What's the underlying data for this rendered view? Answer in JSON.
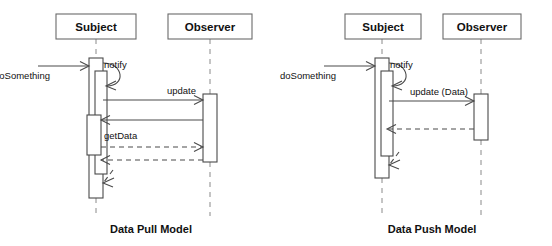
{
  "diagrams": [
    {
      "id": "data-pull",
      "caption": "Data Pull Model",
      "caption_x": 151,
      "caption_y": 233,
      "participants": [
        {
          "name": "Subject",
          "label": "Subject",
          "x": 96,
          "box_x": 56,
          "box_y": 14,
          "box_w": 80,
          "box_h": 25
        },
        {
          "name": "Observer",
          "label": "Observer",
          "x": 210,
          "box_x": 168,
          "box_y": 14,
          "box_w": 84,
          "box_h": 25
        }
      ],
      "messages": [
        {
          "name": "doSomething",
          "label": "doSomething",
          "style": "solid",
          "label_x": 50,
          "label_y": 76
        },
        {
          "name": "notify",
          "label": "notify",
          "style": "solid",
          "label_x": 111,
          "label_y": 65
        },
        {
          "name": "update",
          "label": "update",
          "style": "solid",
          "label_x": 178,
          "label_y": 90
        },
        {
          "name": "getData",
          "label": "getData",
          "style": "solid",
          "label_x": 112,
          "label_y": 136
        }
      ]
    },
    {
      "id": "data-push",
      "caption": "Data Push Model",
      "caption_x": 432,
      "caption_y": 233,
      "participants": [
        {
          "name": "Subject",
          "label": "Subject",
          "x": 382,
          "box_x": 345,
          "box_y": 14,
          "box_w": 76,
          "box_h": 25
        },
        {
          "name": "Observer",
          "label": "Observer",
          "x": 481,
          "box_x": 443,
          "box_y": 14,
          "box_w": 78,
          "box_h": 25
        }
      ],
      "messages": [
        {
          "name": "doSomething",
          "label": "doSomething",
          "style": "solid",
          "label_x": 336,
          "label_y": 76
        },
        {
          "name": "notify",
          "label": "notify",
          "style": "solid",
          "label_x": 397,
          "label_y": 65
        },
        {
          "name": "update-data",
          "label": "update (Data)",
          "style": "solid",
          "label_x": 428,
          "label_y": 92
        }
      ]
    }
  ],
  "colors": {
    "stroke": "#4a4a4a",
    "lifeline": "#8a8a8a",
    "box_stroke": "#6a6a6a",
    "text": "#111111",
    "background": "#ffffff"
  }
}
